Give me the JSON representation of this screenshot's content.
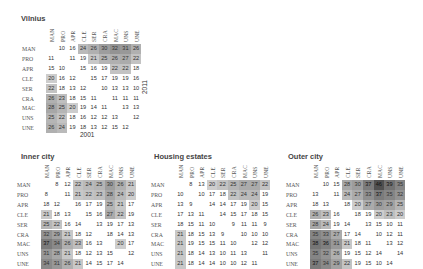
{
  "chart_data": [
    {
      "type": "heatmap",
      "title": "Vilnius",
      "xlabel": "2001",
      "ylabel": "2011",
      "categories": [
        "MAN",
        "PRO",
        "APR",
        "CLE",
        "SER",
        "CRA",
        "MAC",
        "UNS",
        "UNE"
      ],
      "values": [
        [
          null,
          10,
          16,
          24,
          26,
          30,
          32,
          31,
          26
        ],
        [
          11,
          null,
          11,
          19,
          21,
          25,
          26,
          27,
          22
        ],
        [
          15,
          10,
          null,
          15,
          16,
          19,
          22,
          22,
          18
        ],
        [
          20,
          16,
          12,
          null,
          15,
          17,
          19,
          19,
          16
        ],
        [
          22,
          18,
          13,
          12,
          null,
          10,
          13,
          13,
          10
        ],
        [
          26,
          23,
          18,
          15,
          11,
          null,
          11,
          11,
          11
        ],
        [
          28,
          25,
          20,
          19,
          14,
          11,
          null,
          13,
          13
        ],
        [
          25,
          22,
          18,
          16,
          12,
          12,
          13,
          null,
          12
        ],
        [
          26,
          24,
          19,
          18,
          13,
          12,
          15,
          12,
          null
        ]
      ],
      "note": "Upper triangle = 2011, lower triangle = 2001; cells >= 20 shaded"
    },
    {
      "type": "heatmap",
      "title": "Inner city",
      "categories": [
        "MAN",
        "PRO",
        "APR",
        "CLE",
        "SER",
        "CRA",
        "MAC",
        "UNS",
        "UNE"
      ],
      "values": [
        [
          null,
          8,
          12,
          22,
          24,
          25,
          30,
          26,
          21
        ],
        [
          8,
          null,
          11,
          21,
          22,
          23,
          28,
          24,
          20
        ],
        [
          18,
          12,
          null,
          16,
          17,
          19,
          25,
          21,
          17
        ],
        [
          21,
          18,
          13,
          null,
          15,
          16,
          27,
          22,
          19
        ],
        [
          25,
          22,
          16,
          14,
          null,
          13,
          19,
          17,
          13
        ],
        [
          32,
          29,
          21,
          18,
          12,
          null,
          18,
          14,
          13
        ],
        [
          37,
          34,
          26,
          23,
          16,
          13,
          null,
          20,
          17
        ],
        [
          31,
          28,
          21,
          18,
          12,
          13,
          15,
          null,
          12
        ],
        [
          34,
          31,
          26,
          21,
          14,
          15,
          17,
          14,
          null
        ]
      ]
    },
    {
      "type": "heatmap",
      "title": "Housing estates",
      "categories": [
        "MAN",
        "PRO",
        "APR",
        "CLE",
        "SER",
        "CRA",
        "MAC",
        "UNS",
        "UNE"
      ],
      "values": [
        [
          null,
          8,
          13,
          20,
          22,
          25,
          27,
          27,
          22
        ],
        [
          10,
          null,
          10,
          17,
          18,
          22,
          24,
          24,
          19
        ],
        [
          13,
          9,
          null,
          14,
          14,
          17,
          19,
          20,
          15
        ],
        [
          17,
          13,
          11,
          null,
          14,
          15,
          17,
          18,
          15
        ],
        [
          18,
          15,
          11,
          10,
          null,
          9,
          11,
          11,
          9
        ],
        [
          21,
          18,
          15,
          13,
          9,
          null,
          10,
          10,
          10
        ],
        [
          21,
          19,
          15,
          15,
          11,
          10,
          null,
          12,
          12
        ],
        [
          21,
          18,
          14,
          13,
          10,
          11,
          13,
          null,
          11
        ],
        [
          21,
          18,
          14,
          14,
          10,
          10,
          12,
          11,
          null
        ]
      ]
    },
    {
      "type": "heatmap",
      "title": "Outer city",
      "categories": [
        "MAN",
        "PRO",
        "APR",
        "CLE",
        "SER",
        "CRA",
        "MAC",
        "UNS",
        "UNE"
      ],
      "values": [
        [
          null,
          10,
          15,
          28,
          30,
          37,
          46,
          39,
          35
        ],
        [
          13,
          null,
          11,
          24,
          27,
          33,
          37,
          35,
          32
        ],
        [
          18,
          13,
          null,
          18,
          20,
          27,
          30,
          29,
          25
        ],
        [
          26,
          23,
          16,
          null,
          18,
          19,
          20,
          23,
          20
        ],
        [
          28,
          24,
          19,
          14,
          null,
          13,
          15,
          10,
          11
        ],
        [
          35,
          33,
          27,
          17,
          14,
          null,
          10,
          12,
          11
        ],
        [
          38,
          36,
          31,
          21,
          18,
          11,
          null,
          13,
          12
        ],
        [
          35,
          32,
          26,
          19,
          15,
          12,
          14,
          null,
          14
        ],
        [
          37,
          34,
          29,
          22,
          19,
          15,
          10,
          14,
          null
        ]
      ]
    }
  ],
  "panels": {
    "vilnius": {
      "title": "Vilnius",
      "xyear": "2001",
      "yyear": "2011"
    },
    "inner": {
      "title": "Inner city"
    },
    "housing": {
      "title": "Housing estates"
    },
    "outer": {
      "title": "Outer city"
    }
  },
  "labels": [
    "MAN",
    "PRO",
    "APR",
    "CLE",
    "SER",
    "CRA",
    "MAC",
    "UNS",
    "UNE"
  ]
}
